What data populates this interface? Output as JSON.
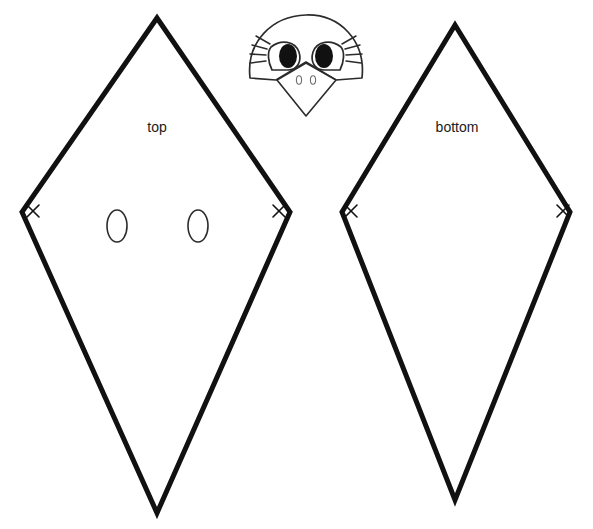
{
  "document": {
    "title": "Bird Mask Craft Template",
    "background_color": "#ffffff",
    "line_color": "#111111",
    "detail_line_color": "#2b2b2b",
    "pupil_color": "#111111",
    "width": 593,
    "height": 529
  },
  "pieces": [
    {
      "id": "top-kite",
      "label": "top",
      "label_x": 157,
      "label_y": 128,
      "outline_points": "157,18 290,212 157,513 22,212",
      "vertex_marks": [
        {
          "name": "left",
          "x": 33,
          "y": 211,
          "size": 6
        },
        {
          "name": "right",
          "x": 279,
          "y": 211,
          "size": 6
        }
      ],
      "eye_holes": [
        {
          "name": "left-eye-hole",
          "cx": 117,
          "cy": 226,
          "rx": 10,
          "ry": 16
        },
        {
          "name": "right-eye-hole",
          "cx": 198,
          "cy": 226,
          "rx": 10,
          "ry": 16
        }
      ]
    },
    {
      "id": "bottom-kite",
      "label": "bottom",
      "label_x": 457,
      "label_y": 128,
      "outline_points": "455,25 570,212 455,500 342,212",
      "vertex_marks": [
        {
          "name": "left",
          "x": 351,
          "y": 211,
          "size": 6
        },
        {
          "name": "right",
          "x": 563,
          "y": 211,
          "size": 6
        }
      ],
      "eye_holes": []
    }
  ],
  "bird_head": {
    "id": "bird-head",
    "head_path": "M 250 78 C 246 42 272 16 306 15 C 340 14 366 41 362 78 L 336 80 L 306 62 L 276 80 Z",
    "beak_path": "M 277 80 L 306 63 L 336 80 L 306 116 Z",
    "eyes": [
      {
        "name": "left-eye",
        "outline_path": "M 271 47 C 281 39 295 41 299 52 C 302 62 297 70 288 70 L 272 70 C 268 62 267 52 271 47 Z",
        "pupil_cx": 288,
        "pupil_cy": 56,
        "pupil_rx": 9,
        "pupil_ry": 12,
        "lashes": [
          "M 270 44 L 256 36",
          "M 267 49 L 252 45",
          "M 266 55 L 250 54",
          "M 266 61 L 251 63"
        ]
      },
      {
        "name": "right-eye",
        "outline_path": "M 341 47 C 331 39 317 41 313 52 C 310 62 315 70 324 70 L 340 70 C 344 62 345 52 341 47 Z",
        "pupil_cx": 324,
        "pupil_cy": 56,
        "pupil_rx": 9,
        "pupil_ry": 12,
        "lashes": [
          "M 342 44 L 356 36",
          "M 345 49 L 360 45",
          "M 346 55 L 362 54",
          "M 346 61 L 361 63"
        ]
      }
    ],
    "nostrils": [
      {
        "name": "left-nostril",
        "cx": 299,
        "cy": 80,
        "rx": 2.6,
        "ry": 4.2
      },
      {
        "name": "right-nostril",
        "cx": 313,
        "cy": 80,
        "rx": 2.6,
        "ry": 4.2
      }
    ]
  }
}
